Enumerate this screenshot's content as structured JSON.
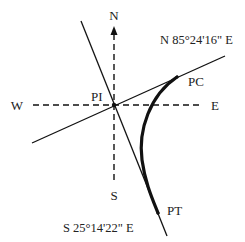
{
  "diagram": {
    "type": "horizontal-curve",
    "compass": {
      "north": "N",
      "south": "S",
      "east": "E",
      "west": "W"
    },
    "points": {
      "pi": "PI",
      "pc": "PC",
      "pt": "PT"
    },
    "bearings": {
      "back_tangent": "N 85°24'16\" E",
      "forward_tangent": "S 25°14'22\" E"
    },
    "colors": {
      "line": "#111111",
      "text": "#222222",
      "background": "#ffffff"
    }
  }
}
